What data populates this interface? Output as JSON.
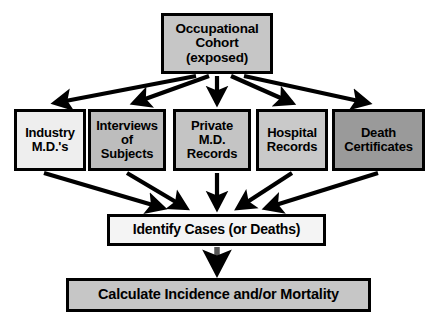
{
  "diagram": {
    "background_color": "#ffffff",
    "line_color": "#000000",
    "nodes": {
      "cohort": {
        "label": "Occupational\nCohort\n(exposed)",
        "fill": "#c6c6c6"
      },
      "identify": {
        "label": "Identify Cases (or Deaths)",
        "fill": "#f4f4f4"
      },
      "calculate": {
        "label": "Calculate Incidence and/or Mortality",
        "fill": "#c6c6c6"
      }
    },
    "sources": [
      {
        "id": "industry",
        "label": "Industry\nM.D.'s",
        "fill": "#eeeeee"
      },
      {
        "id": "interviews",
        "label": "Interviews\nof\nSubjects",
        "fill": "#bdbdbd"
      },
      {
        "id": "private",
        "label": "Private\nM.D.\nRecords",
        "fill": "#c4c4c4"
      },
      {
        "id": "hospital",
        "label": "Hospital\nRecords",
        "fill": "#c9c9c9"
      },
      {
        "id": "death",
        "label": "Death\nCertificates",
        "fill": "#9a9a9a"
      }
    ],
    "edges": [
      {
        "from": "cohort",
        "to": "industry"
      },
      {
        "from": "cohort",
        "to": "interviews"
      },
      {
        "from": "cohort",
        "to": "private"
      },
      {
        "from": "cohort",
        "to": "hospital"
      },
      {
        "from": "cohort",
        "to": "death"
      },
      {
        "from": "industry",
        "to": "identify"
      },
      {
        "from": "interviews",
        "to": "identify"
      },
      {
        "from": "private",
        "to": "identify"
      },
      {
        "from": "hospital",
        "to": "identify"
      },
      {
        "from": "death",
        "to": "identify"
      },
      {
        "from": "identify",
        "to": "calculate"
      }
    ]
  }
}
